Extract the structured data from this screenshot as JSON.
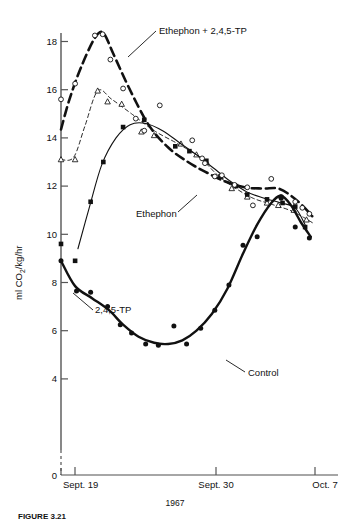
{
  "figure": {
    "caption": "FIGURE 3.21",
    "year_label": "1967"
  },
  "axes": {
    "y_title": "ml CO",
    "y_title_sub": "2",
    "y_title_rest": "/kg/hr",
    "y_ticks": [
      "0",
      "4",
      "6",
      "8",
      "10",
      "12",
      "14",
      "16",
      "18"
    ],
    "x_ticks": [
      "Sept. 19",
      "Sept. 30",
      "Oct. 7"
    ]
  },
  "series_labels": {
    "ethephon_tp": "Ethephon + 2,4,5-TP",
    "ethephon": "Ethephon",
    "tp": "2,4,5-TP",
    "control": "Control"
  },
  "chart_data": {
    "type": "line",
    "title": "",
    "xlabel": "1967",
    "ylabel": "ml CO2/kg/hr",
    "xlim": [
      0,
      18
    ],
    "ylim": [
      0,
      19
    ],
    "ybreak": [
      0,
      4
    ],
    "grid": false,
    "legend": "inline-annotations",
    "x_tick_values": [
      0,
      11,
      18
    ],
    "x_tick_labels": [
      "Sept. 19",
      "Sept. 30",
      "Oct. 7"
    ],
    "y_tick_values": [
      0,
      4,
      6,
      8,
      10,
      12,
      14,
      16,
      18
    ],
    "series": [
      {
        "name": "Ethephon + 2,4,5-TP",
        "marker": "open-circle",
        "line": "thick-dashed",
        "points": [
          {
            "x": 0.0,
            "y": 15.6
          },
          {
            "x": 1.0,
            "y": 16.25
          },
          {
            "x": 2.4,
            "y": 18.25
          },
          {
            "x": 2.95,
            "y": 18.3
          },
          {
            "x": 3.5,
            "y": 17.25
          },
          {
            "x": 4.4,
            "y": 16.05
          },
          {
            "x": 5.3,
            "y": 14.8
          },
          {
            "x": 5.9,
            "y": 14.3
          },
          {
            "x": 7.0,
            "y": 15.35
          },
          {
            "x": 9.3,
            "y": 13.9
          },
          {
            "x": 10.0,
            "y": 13.15
          },
          {
            "x": 10.2,
            "y": 12.95
          },
          {
            "x": 10.9,
            "y": 12.4
          },
          {
            "x": 11.4,
            "y": 12.45
          },
          {
            "x": 12.3,
            "y": 12.05
          },
          {
            "x": 13.2,
            "y": 11.95
          },
          {
            "x": 13.6,
            "y": 11.2
          },
          {
            "x": 14.9,
            "y": 12.3
          },
          {
            "x": 15.6,
            "y": 11.55
          },
          {
            "x": 16.6,
            "y": 11.35
          },
          {
            "x": 17.1,
            "y": 11.1
          },
          {
            "x": 17.6,
            "y": 10.85
          }
        ]
      },
      {
        "name": "Ethephon",
        "marker": "open-triangle",
        "line": "thin-dashed",
        "points": [
          {
            "x": 0.0,
            "y": 13.1
          },
          {
            "x": 1.0,
            "y": 13.1
          },
          {
            "x": 2.6,
            "y": 15.95
          },
          {
            "x": 3.3,
            "y": 15.5
          },
          {
            "x": 4.3,
            "y": 15.4
          },
          {
            "x": 5.7,
            "y": 14.25
          },
          {
            "x": 6.6,
            "y": 14.1
          },
          {
            "x": 8.5,
            "y": 13.75
          },
          {
            "x": 9.6,
            "y": 13.3
          },
          {
            "x": 10.3,
            "y": 13.0
          },
          {
            "x": 11.3,
            "y": 12.4
          },
          {
            "x": 12.1,
            "y": 11.9
          },
          {
            "x": 13.2,
            "y": 11.55
          },
          {
            "x": 14.6,
            "y": 11.3
          },
          {
            "x": 15.4,
            "y": 11.2
          },
          {
            "x": 16.5,
            "y": 11.0
          },
          {
            "x": 17.4,
            "y": 10.6
          }
        ]
      },
      {
        "name": "2,4,5-TP",
        "marker": "filled-square",
        "line": "thin-solid",
        "points": [
          {
            "x": 0.0,
            "y": 9.6
          },
          {
            "x": 1.0,
            "y": 8.9
          },
          {
            "x": 2.1,
            "y": 11.35
          },
          {
            "x": 3.0,
            "y": 13.0
          },
          {
            "x": 4.4,
            "y": 14.45
          },
          {
            "x": 5.9,
            "y": 14.75
          },
          {
            "x": 8.1,
            "y": 13.65
          },
          {
            "x": 9.1,
            "y": 13.45
          },
          {
            "x": 10.3,
            "y": 13.05
          },
          {
            "x": 11.3,
            "y": 12.4
          },
          {
            "x": 12.4,
            "y": 12.0
          },
          {
            "x": 13.2,
            "y": 11.65
          },
          {
            "x": 14.6,
            "y": 11.45
          },
          {
            "x": 15.7,
            "y": 11.3
          },
          {
            "x": 16.6,
            "y": 11.15
          },
          {
            "x": 17.3,
            "y": 10.3
          }
        ]
      },
      {
        "name": "Control",
        "marker": "filled-circle",
        "line": "thick-solid",
        "points": [
          {
            "x": 0.0,
            "y": 8.9
          },
          {
            "x": 1.1,
            "y": 7.65
          },
          {
            "x": 2.1,
            "y": 7.6
          },
          {
            "x": 3.3,
            "y": 7.0
          },
          {
            "x": 4.2,
            "y": 6.25
          },
          {
            "x": 5.0,
            "y": 5.9
          },
          {
            "x": 6.0,
            "y": 5.45
          },
          {
            "x": 6.9,
            "y": 5.4
          },
          {
            "x": 8.0,
            "y": 6.2
          },
          {
            "x": 8.9,
            "y": 5.45
          },
          {
            "x": 9.9,
            "y": 6.1
          },
          {
            "x": 10.9,
            "y": 6.85
          },
          {
            "x": 11.9,
            "y": 7.9
          },
          {
            "x": 12.9,
            "y": 9.55
          },
          {
            "x": 13.9,
            "y": 9.9
          },
          {
            "x": 15.6,
            "y": 11.5
          },
          {
            "x": 16.6,
            "y": 10.3
          },
          {
            "x": 17.6,
            "y": 9.85
          }
        ]
      }
    ]
  }
}
